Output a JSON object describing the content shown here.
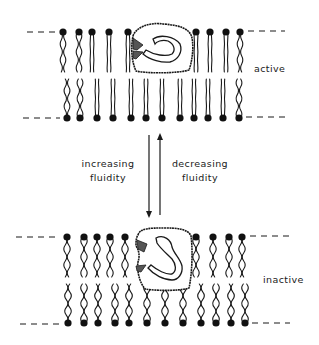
{
  "labels": {
    "active": "active",
    "inactive": "inactive",
    "increasing_1": "increasing",
    "increasing_2": "fluidity",
    "decreasing_1": "decreasing",
    "decreasing_2": "fluidity"
  },
  "colors": {
    "ink": "#1a1a1a",
    "background": "#ffffff"
  },
  "bilayers": [
    {
      "state": "active",
      "top_y": 32,
      "bottom_y": 118,
      "top_heads_x": [
        63,
        79,
        92,
        109,
        128,
        196,
        210,
        226,
        240
      ],
      "bottom_heads_x": [
        67,
        80,
        97,
        113,
        131,
        146,
        162,
        180,
        194,
        208,
        223,
        239
      ],
      "tail_style": "straight"
    },
    {
      "state": "inactive",
      "top_y": 237,
      "bottom_y": 323,
      "top_heads_x": [
        67,
        84,
        97,
        110,
        125,
        196,
        213,
        229,
        242
      ],
      "bottom_heads_x": [
        68,
        84,
        98,
        115,
        129,
        147,
        165,
        183,
        201,
        216,
        231,
        245
      ],
      "tail_style": "wavy"
    }
  ],
  "arrows": [
    {
      "direction": "down",
      "x": 149,
      "y1": 135,
      "y2": 217
    },
    {
      "direction": "up",
      "x": 160,
      "y1": 133,
      "y2": 215
    }
  ]
}
